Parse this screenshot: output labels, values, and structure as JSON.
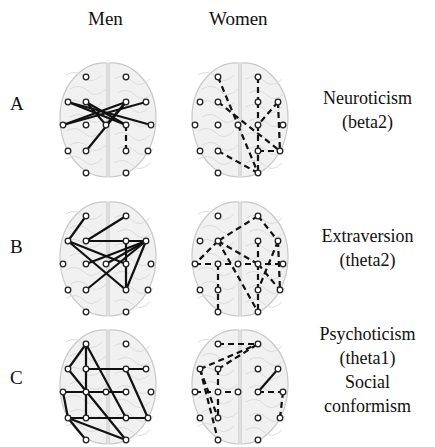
{
  "columns": [
    {
      "label": "Men"
    },
    {
      "label": "Women"
    }
  ],
  "rows": [
    {
      "label": "A",
      "trait_lines": [
        "Neuroticism",
        "(beta2)"
      ]
    },
    {
      "label": "B",
      "trait_lines": [
        "Extraversion",
        "(theta2)"
      ]
    },
    {
      "label": "C",
      "trait_lines": [
        "Psychoticism",
        "(theta1)",
        "Social",
        "conformism"
      ]
    }
  ],
  "legend_semantics": {
    "solid_line": "connection (solid)",
    "dashed_line": "connection (dashed)"
  },
  "electrodes": [
    [
      28,
      22
    ],
    [
      68,
      22
    ],
    [
      10,
      47
    ],
    [
      28,
      47
    ],
    [
      68,
      47
    ],
    [
      88,
      47
    ],
    [
      5,
      70
    ],
    [
      28,
      70
    ],
    [
      48,
      70
    ],
    [
      68,
      70
    ],
    [
      93,
      70
    ],
    [
      10,
      96
    ],
    [
      28,
      96
    ],
    [
      68,
      96
    ],
    [
      90,
      96
    ],
    [
      28,
      118
    ],
    [
      68,
      118
    ]
  ],
  "panels": {
    "A_men": {
      "style": "solid",
      "edges": [
        [
          2,
          9
        ],
        [
          2,
          10
        ],
        [
          3,
          9
        ],
        [
          4,
          6
        ],
        [
          5,
          6
        ],
        [
          4,
          12
        ],
        [
          4,
          8
        ],
        [
          3,
          8
        ]
      ],
      "dashed": [
        [
          9,
          13
        ]
      ]
    },
    "A_women": {
      "style": "dashed",
      "edges": [
        [
          0,
          8
        ],
        [
          3,
          14
        ],
        [
          1,
          4
        ],
        [
          4,
          9
        ],
        [
          5,
          9
        ],
        [
          5,
          14
        ],
        [
          8,
          16
        ],
        [
          9,
          16
        ],
        [
          12,
          16
        ],
        [
          13,
          14
        ]
      ]
    },
    "B_men": {
      "style": "solid",
      "edges": [
        [
          0,
          2
        ],
        [
          1,
          3
        ],
        [
          2,
          13
        ],
        [
          2,
          9
        ],
        [
          3,
          5
        ],
        [
          5,
          7
        ],
        [
          5,
          12
        ],
        [
          5,
          13
        ],
        [
          4,
          13
        ],
        [
          8,
          5
        ]
      ]
    },
    "B_women": {
      "style": "dashed",
      "edges": [
        [
          1,
          3
        ],
        [
          1,
          5
        ],
        [
          3,
          6
        ],
        [
          3,
          9
        ],
        [
          3,
          16
        ],
        [
          6,
          10
        ],
        [
          4,
          9
        ],
        [
          9,
          14
        ],
        [
          5,
          14
        ],
        [
          7,
          15
        ],
        [
          9,
          16
        ],
        [
          5,
          13
        ]
      ]
    },
    "C_men": {
      "style": "solid",
      "edges": [
        [
          0,
          2
        ],
        [
          0,
          13
        ],
        [
          0,
          12
        ],
        [
          2,
          16
        ],
        [
          3,
          5
        ],
        [
          6,
          9
        ],
        [
          6,
          11
        ],
        [
          11,
          15
        ],
        [
          11,
          14
        ],
        [
          7,
          9
        ],
        [
          4,
          14
        ],
        [
          11,
          16
        ],
        [
          12,
          13
        ]
      ]
    },
    "C_women": {
      "style": "dashed",
      "edges": [
        [
          0,
          1
        ],
        [
          2,
          1
        ],
        [
          2,
          15
        ],
        [
          3,
          1
        ],
        [
          3,
          12
        ],
        [
          6,
          8
        ],
        [
          2,
          12
        ],
        [
          9,
          10
        ],
        [
          10,
          14
        ]
      ],
      "solid": [
        [
          5,
          9
        ]
      ]
    }
  }
}
